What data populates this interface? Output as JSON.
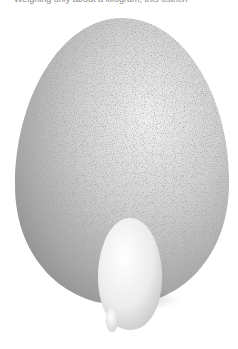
{
  "caption": {
    "text": "Weighing only about a kilogram, this ostrich"
  },
  "image": {
    "subject": "eggs-size-comparison",
    "eggs": [
      {
        "name": "ostrich-egg",
        "color": "#c9c9c9"
      },
      {
        "name": "chicken-egg",
        "color": "#ececec"
      },
      {
        "name": "hummingbird-egg",
        "color": "#f4f4f4"
      }
    ]
  }
}
